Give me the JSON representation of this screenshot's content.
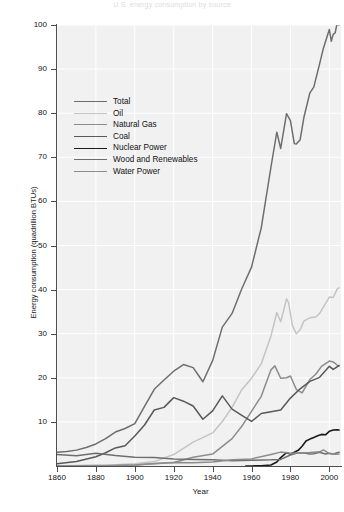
{
  "chart_data": {
    "type": "line",
    "title": "U.S. energy consumption by source",
    "xlabel": "Year",
    "ylabel": "Energy consumption (quadrillion BTUs)",
    "xlim": [
      1860,
      2006
    ],
    "ylim": [
      0,
      100
    ],
    "xticks": [
      1860,
      1880,
      1900,
      1920,
      1940,
      1960,
      1980,
      2000
    ],
    "yticks": [
      10,
      20,
      30,
      40,
      50,
      60,
      70,
      80,
      90,
      100
    ],
    "grid": true,
    "legend_position": "upper left",
    "series": [
      {
        "name": "Total",
        "color": "#6e6e6e",
        "width": 1.5,
        "x": [
          1860,
          1865,
          1870,
          1875,
          1880,
          1885,
          1890,
          1895,
          1900,
          1905,
          1910,
          1915,
          1920,
          1925,
          1930,
          1935,
          1940,
          1945,
          1950,
          1955,
          1960,
          1965,
          1970,
          1973,
          1975,
          1978,
          1980,
          1982,
          1983,
          1985,
          1987,
          1990,
          1992,
          1995,
          1997,
          2000,
          2001,
          2002,
          2003,
          2004,
          2005
        ],
        "y": [
          3.1,
          3.3,
          3.6,
          4.2,
          5.0,
          6.2,
          7.7,
          8.5,
          9.6,
          13.5,
          17.4,
          19.5,
          21.5,
          23.0,
          22.3,
          19.1,
          23.9,
          31.5,
          34.6,
          40.2,
          45.1,
          54.0,
          67.8,
          75.7,
          72.0,
          79.9,
          78.3,
          73.1,
          73.0,
          74.0,
          79.2,
          84.6,
          85.9,
          91.2,
          94.8,
          99.0,
          96.3,
          97.9,
          98.2,
          100.4,
          100.0
        ]
      },
      {
        "name": "Oil",
        "color": "#c4c4c4",
        "width": 1.5,
        "x": [
          1860,
          1870,
          1880,
          1890,
          1900,
          1910,
          1920,
          1930,
          1940,
          1945,
          1950,
          1955,
          1960,
          1965,
          1970,
          1973,
          1975,
          1978,
          1979,
          1981,
          1983,
          1985,
          1987,
          1990,
          1993,
          1995,
          1998,
          2000,
          2002,
          2004,
          2005
        ],
        "y": [
          0.0,
          0.1,
          0.2,
          0.3,
          0.5,
          1.0,
          2.6,
          5.4,
          7.5,
          10.1,
          13.3,
          17.3,
          19.9,
          23.2,
          29.5,
          34.8,
          32.7,
          37.9,
          37.1,
          31.9,
          30.0,
          30.9,
          32.9,
          33.6,
          33.8,
          34.6,
          36.8,
          38.3,
          38.2,
          40.1,
          40.4
        ]
      },
      {
        "name": "Natural Gas",
        "color": "#8c8c8c",
        "width": 1.5,
        "x": [
          1860,
          1880,
          1890,
          1900,
          1910,
          1920,
          1930,
          1940,
          1950,
          1955,
          1960,
          1965,
          1970,
          1972,
          1975,
          1978,
          1980,
          1983,
          1986,
          1990,
          1993,
          1996,
          2000,
          2002,
          2004,
          2005
        ],
        "y": [
          0.0,
          0.0,
          0.1,
          0.25,
          0.5,
          0.8,
          2.0,
          2.7,
          6.2,
          9.0,
          12.4,
          15.8,
          21.8,
          22.7,
          19.9,
          20.0,
          20.4,
          17.4,
          16.6,
          19.6,
          20.8,
          22.6,
          23.8,
          23.6,
          22.9,
          22.6
        ]
      },
      {
        "name": "Coal",
        "color": "#595959",
        "width": 1.5,
        "x": [
          1860,
          1870,
          1880,
          1885,
          1890,
          1895,
          1900,
          1905,
          1910,
          1915,
          1920,
          1925,
          1930,
          1935,
          1940,
          1945,
          1950,
          1955,
          1960,
          1965,
          1970,
          1975,
          1980,
          1985,
          1990,
          1995,
          2000,
          2002,
          2004,
          2005
        ],
        "y": [
          0.5,
          1.0,
          2.1,
          3.0,
          4.1,
          4.6,
          6.8,
          9.3,
          12.7,
          13.3,
          15.5,
          14.7,
          13.6,
          10.6,
          12.5,
          15.9,
          12.9,
          11.5,
          10.1,
          11.9,
          12.3,
          12.7,
          15.4,
          17.5,
          19.2,
          20.1,
          22.6,
          21.9,
          22.5,
          22.8
        ]
      },
      {
        "name": "Nuclear Power",
        "color": "#1a1a1a",
        "width": 1.6,
        "x": [
          1957,
          1960,
          1965,
          1970,
          1973,
          1975,
          1978,
          1980,
          1982,
          1984,
          1986,
          1988,
          1990,
          1992,
          1994,
          1996,
          1998,
          2000,
          2002,
          2004,
          2005
        ],
        "y": [
          0.0,
          0.01,
          0.04,
          0.24,
          0.91,
          1.9,
          3.02,
          2.74,
          3.13,
          3.55,
          4.47,
          5.66,
          6.1,
          6.48,
          6.84,
          7.17,
          7.07,
          7.86,
          8.15,
          8.23,
          8.16
        ]
      },
      {
        "name": "Wood and Renewables",
        "color": "#6e6e6e",
        "width": 1.5,
        "x": [
          1860,
          1870,
          1880,
          1890,
          1900,
          1910,
          1920,
          1930,
          1940,
          1950,
          1960,
          1970,
          1975,
          1980,
          1983,
          1985,
          1988,
          1990,
          1992,
          1995,
          1998,
          2000,
          2002,
          2004,
          2005
        ],
        "y": [
          2.6,
          2.3,
          2.9,
          2.4,
          2.0,
          1.9,
          1.6,
          1.5,
          1.4,
          1.2,
          1.3,
          1.4,
          1.5,
          2.5,
          2.9,
          3.0,
          2.9,
          2.7,
          2.8,
          3.1,
          2.7,
          2.9,
          2.7,
          3.0,
          3.1
        ]
      },
      {
        "name": "Water Power",
        "color": "#8c8c8c",
        "width": 1.5,
        "x": [
          1860,
          1880,
          1890,
          1900,
          1910,
          1920,
          1930,
          1940,
          1950,
          1960,
          1970,
          1975,
          1980,
          1985,
          1990,
          1995,
          1997,
          2000,
          2002,
          2004,
          2005
        ],
        "y": [
          0.0,
          0.0,
          0.1,
          0.25,
          0.54,
          0.79,
          0.75,
          0.92,
          1.42,
          1.61,
          2.63,
          3.15,
          2.9,
          2.97,
          3.05,
          3.21,
          3.64,
          2.81,
          2.69,
          2.69,
          2.7
        ]
      }
    ]
  },
  "axes": {
    "y_ticklabels": [
      "100",
      "90",
      "80",
      "70",
      "60",
      "50",
      "40",
      "30",
      "20",
      "10"
    ],
    "x_ticklabels": [
      "1860",
      "1880",
      "1900",
      "1920",
      "1940",
      "1960",
      "1980",
      "2000"
    ],
    "xlabel": "Year",
    "ylabel": "Energy consumption (quadrillion BTUs)"
  },
  "legend": {
    "items": [
      {
        "label": "Total",
        "color": "#6e6e6e",
        "width": "1.5px"
      },
      {
        "label": "Oil",
        "color": "#c4c4c4",
        "width": "1.5px"
      },
      {
        "label": "Natural Gas",
        "color": "#8c8c8c",
        "width": "1.5px"
      },
      {
        "label": "Coal",
        "color": "#595959",
        "width": "1.5px"
      },
      {
        "label": "Nuclear Power",
        "color": "#1a1a1a",
        "width": "1.8px"
      },
      {
        "label": "Wood and Renewables",
        "color": "#6e6e6e",
        "width": "1.5px"
      },
      {
        "label": "Water Power",
        "color": "#8c8c8c",
        "width": "1.5px"
      }
    ]
  },
  "style": {
    "plot_background": "#f1f1f1",
    "grid_color": "#ffffff",
    "axis_color": "#4d4d4d",
    "text_color": "#111111",
    "page_background": "#ffffff"
  }
}
